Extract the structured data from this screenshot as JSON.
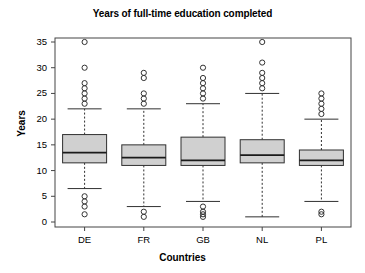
{
  "chart_data": {
    "type": "box",
    "title": "Years of full-time education completed",
    "xlabel": "Countries",
    "ylabel": "Years",
    "categories": [
      "DE",
      "FR",
      "GB",
      "NL",
      "PL"
    ],
    "ylim": [
      0,
      35
    ],
    "yticks": [
      0,
      5,
      10,
      15,
      20,
      25,
      30,
      35
    ],
    "ytick_labels": [
      "0",
      "5",
      "10",
      "15",
      "20",
      "25",
      "30",
      "35"
    ],
    "grid": false,
    "legend": "none",
    "box_fill_color": "#D0D0D0",
    "box_line_color": "#303030",
    "series": [
      {
        "name": "DE",
        "min_whisker": 6.5,
        "q1": 11.5,
        "median": 13.5,
        "q3": 17.0,
        "max_whisker": 22.0,
        "outliers_high": [
          23,
          24,
          25,
          26,
          27,
          30,
          35
        ],
        "outliers_low": [
          5,
          4,
          3,
          1.5
        ]
      },
      {
        "name": "FR",
        "min_whisker": 3.0,
        "q1": 11.0,
        "median": 12.5,
        "q3": 15.0,
        "max_whisker": 22.0,
        "outliers_high": [
          23,
          24,
          25,
          28,
          29
        ],
        "outliers_low": [
          2,
          1
        ]
      },
      {
        "name": "GB",
        "min_whisker": 4.0,
        "q1": 11.0,
        "median": 12.0,
        "q3": 16.5,
        "max_whisker": 23.0,
        "outliers_high": [
          24,
          25,
          26,
          27,
          28,
          30
        ],
        "outliers_low": [
          3,
          2,
          1.5,
          1
        ]
      },
      {
        "name": "NL",
        "min_whisker": 1.0,
        "q1": 11.5,
        "median": 13.0,
        "q3": 16.0,
        "max_whisker": 25.0,
        "outliers_high": [
          26,
          27,
          28,
          29,
          31,
          35
        ],
        "outliers_low": []
      },
      {
        "name": "PL",
        "min_whisker": 4.0,
        "q1": 11.0,
        "median": 12.0,
        "q3": 14.0,
        "max_whisker": 20.0,
        "outliers_high": [
          21,
          22,
          23,
          24,
          25
        ],
        "outliers_low": [
          2,
          1.5
        ]
      }
    ]
  }
}
